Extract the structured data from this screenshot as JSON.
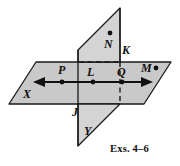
{
  "figure": {
    "name": "two-intersecting-planes-diagram",
    "caption": "Exs. 4–6",
    "width": 180,
    "height": 166,
    "background": "#ffffff",
    "plane_fill": "#c9c9c9",
    "plane_fill_light": "#d6d6d6",
    "stroke": "#1a1a1a",
    "dash_color": "#1a1a1a"
  },
  "planes": [
    {
      "id": "horizontal-plane-x",
      "label": "X",
      "label_x": 24,
      "label_y": 92,
      "points": "36,62 171,62 144,104 9,104"
    },
    {
      "id": "vertical-plane-y-upper",
      "label": "N",
      "points": "120,8 120,62 78,62 78,50"
    },
    {
      "id": "vertical-plane-y-lower",
      "label": "Y",
      "label_x": 84,
      "label_y": 129,
      "points": "78,104 120,104 78,146"
    }
  ],
  "labels": [
    {
      "id": "label-N",
      "text": "N",
      "x": 105,
      "y": 40
    },
    {
      "id": "label-K",
      "text": "K",
      "x": 113,
      "y": 47
    },
    {
      "id": "label-P",
      "text": "P",
      "x": 58,
      "y": 68
    },
    {
      "id": "label-L",
      "text": "L",
      "x": 84,
      "y": 70
    },
    {
      "id": "label-Q",
      "text": "Q",
      "x": 118,
      "y": 69
    },
    {
      "id": "label-M",
      "text": "M",
      "x": 141,
      "y": 68
    },
    {
      "id": "label-X",
      "text": "X",
      "x": 24,
      "y": 92
    },
    {
      "id": "label-J",
      "text": "J",
      "x": 73,
      "y": 111
    },
    {
      "id": "label-Y",
      "text": "Y",
      "x": 84,
      "y": 129
    }
  ],
  "points": [
    {
      "id": "point-N",
      "label": "N",
      "x": 110,
      "y": 33
    },
    {
      "id": "point-P",
      "label": "P",
      "x": 62,
      "y": 82
    },
    {
      "id": "point-L",
      "label": "L",
      "x": 93,
      "y": 82
    },
    {
      "id": "point-Q",
      "label": "Q",
      "x": 122,
      "y": 82
    },
    {
      "id": "point-M",
      "label": "M",
      "x": 155,
      "y": 68
    }
  ],
  "line": {
    "id": "double-arrow-line",
    "x1": 36,
    "x2": 150,
    "y": 82,
    "arrow_left": true,
    "arrow_right": true
  },
  "dashed": [
    {
      "id": "dashed-top-edge",
      "x1": 78,
      "y1": 62,
      "x2": 120,
      "y2": 62
    },
    {
      "id": "dashed-vertical-hidden",
      "x1": 120,
      "y1": 62,
      "x2": 120,
      "y2": 104
    }
  ]
}
